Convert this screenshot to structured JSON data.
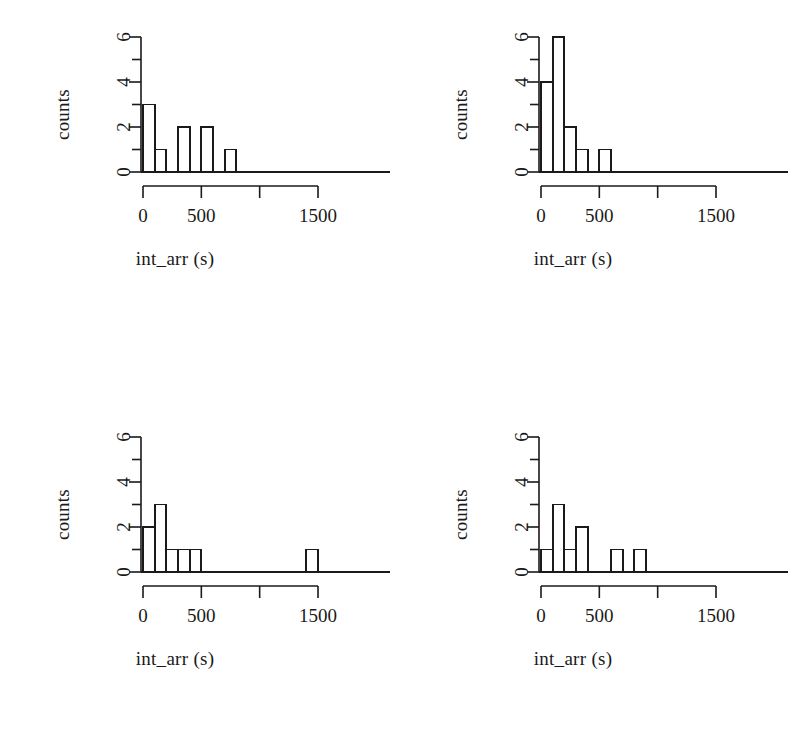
{
  "figure": {
    "panel_count": 4,
    "axis_color": "#1a1a1a",
    "bar_fill": "#ffffff",
    "bar_stroke": "#1a1a1a",
    "background": "#ffffff"
  },
  "caption": {
    "text": ""
  },
  "chart_data": [
    {
      "type": "bar",
      "panel": "top-left",
      "title": "",
      "xlabel": "int_arr (s)",
      "ylabel": "counts",
      "xlim": [
        0,
        1800
      ],
      "ylim": [
        0,
        6
      ],
      "xticks": [
        0,
        500,
        1000,
        1500
      ],
      "xtick_labels": [
        "0",
        "500",
        "",
        "1500"
      ],
      "yticks": [
        0,
        1,
        2,
        3,
        4,
        5,
        6
      ],
      "ytick_labels": [
        "0",
        "",
        "2",
        "",
        "4",
        "",
        "6"
      ],
      "bin_width": 100,
      "bin_edges": [
        0,
        100,
        200,
        300,
        400,
        500,
        600,
        700,
        800,
        900,
        1000
      ],
      "values": [
        3,
        1,
        0,
        2,
        0,
        2,
        0,
        1,
        0,
        0
      ],
      "grid": false,
      "legend": false
    },
    {
      "type": "bar",
      "panel": "top-right",
      "title": "",
      "xlabel": "int_arr (s)",
      "ylabel": "counts",
      "xlim": [
        0,
        1800
      ],
      "ylim": [
        0,
        6
      ],
      "xticks": [
        0,
        500,
        1000,
        1500
      ],
      "xtick_labels": [
        "0",
        "500",
        "",
        "1500"
      ],
      "yticks": [
        0,
        1,
        2,
        3,
        4,
        5,
        6
      ],
      "ytick_labels": [
        "0",
        "",
        "2",
        "",
        "4",
        "",
        "6"
      ],
      "bin_width": 100,
      "bin_edges": [
        0,
        100,
        200,
        300,
        400,
        500,
        600,
        700
      ],
      "values": [
        4,
        6,
        2,
        1,
        0,
        1,
        0
      ],
      "grid": false,
      "legend": false
    },
    {
      "type": "bar",
      "panel": "bottom-left",
      "title": "",
      "xlabel": "int_arr (s)",
      "ylabel": "counts",
      "xlim": [
        0,
        1800
      ],
      "ylim": [
        0,
        6
      ],
      "xticks": [
        0,
        500,
        1000,
        1500
      ],
      "xtick_labels": [
        "0",
        "500",
        "",
        "1500"
      ],
      "yticks": [
        0,
        1,
        2,
        3,
        4,
        5,
        6
      ],
      "ytick_labels": [
        "0",
        "",
        "2",
        "",
        "4",
        "",
        "6"
      ],
      "bin_width": 100,
      "bin_edges": [
        0,
        100,
        200,
        300,
        400,
        500,
        600,
        700,
        800,
        900,
        1000,
        1100,
        1200,
        1300,
        1400,
        1500
      ],
      "values": [
        2,
        3,
        1,
        1,
        1,
        0,
        0,
        0,
        0,
        0,
        0,
        0,
        0,
        0,
        1
      ],
      "grid": false,
      "legend": false
    },
    {
      "type": "bar",
      "panel": "bottom-right",
      "title": "",
      "xlabel": "int_arr (s)",
      "ylabel": "counts",
      "xlim": [
        0,
        1800
      ],
      "ylim": [
        0,
        6
      ],
      "xticks": [
        0,
        500,
        1000,
        1500
      ],
      "xtick_labels": [
        "0",
        "500",
        "",
        "1500"
      ],
      "yticks": [
        0,
        1,
        2,
        3,
        4,
        5,
        6
      ],
      "ytick_labels": [
        "0",
        "",
        "2",
        "",
        "4",
        "",
        "6"
      ],
      "bin_width": 100,
      "bin_edges": [
        0,
        100,
        200,
        300,
        400,
        500,
        600,
        700,
        800,
        900,
        1000,
        1100
      ],
      "values": [
        1,
        3,
        1,
        2,
        0,
        0,
        1,
        0,
        1,
        0,
        0
      ],
      "grid": false,
      "legend": false
    }
  ]
}
